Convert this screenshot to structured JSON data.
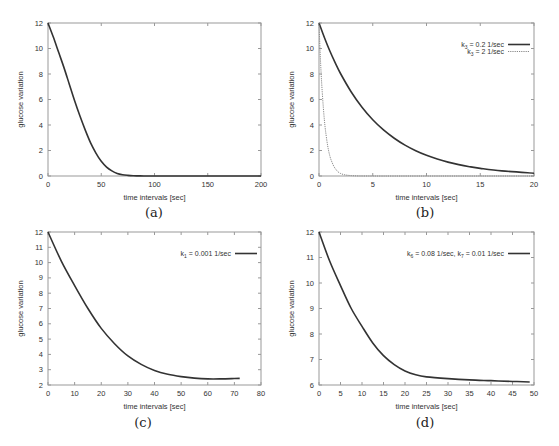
{
  "chart_data": [
    {
      "id": "a",
      "caption": "(a)",
      "type": "line",
      "title": "",
      "xlabel": "time intervals [sec]",
      "ylabel": "glucose variation",
      "xlim": [
        0,
        200
      ],
      "ylim": [
        0,
        12
      ],
      "xticks": [
        0,
        50,
        100,
        150,
        200
      ],
      "yticks": [
        0,
        2,
        4,
        6,
        8,
        10,
        12
      ],
      "grid": false,
      "legend": null,
      "series": [
        {
          "name": "glucose",
          "style": "solid",
          "color": "#333333",
          "x": [
            0,
            5,
            10,
            15,
            20,
            25,
            30,
            35,
            40,
            45,
            50,
            55,
            60,
            65,
            70,
            75,
            80,
            85,
            90,
            100,
            120,
            150,
            200
          ],
          "y": [
            12,
            10.9,
            9.7,
            8.5,
            7.2,
            5.9,
            4.7,
            3.6,
            2.6,
            1.8,
            1.15,
            0.7,
            0.4,
            0.2,
            0.1,
            0.05,
            0.02,
            0.01,
            0.0,
            0.0,
            0.0,
            0.0,
            0.0
          ]
        }
      ]
    },
    {
      "id": "b",
      "caption": "(b)",
      "type": "line",
      "title": "",
      "xlabel": "time intervals [sec]",
      "ylabel": "glucose variation",
      "xlim": [
        0,
        20
      ],
      "ylim": [
        0,
        12
      ],
      "xticks": [
        0,
        5,
        10,
        15,
        20
      ],
      "yticks": [
        0,
        2,
        4,
        6,
        8,
        10,
        12
      ],
      "grid": false,
      "legend": {
        "position": "top-right"
      },
      "series": [
        {
          "name": "k3 = 0.2 1/sec",
          "label_main": "k",
          "label_sub": "3",
          "label_rest": " = 0.2 1/sec",
          "style": "solid",
          "color": "#333333",
          "x": [
            0,
            0.5,
            1,
            1.5,
            2,
            3,
            4,
            5,
            6,
            7,
            8,
            9,
            10,
            11,
            12,
            13,
            14,
            15,
            17,
            20
          ],
          "y": [
            12,
            10.86,
            9.82,
            8.89,
            8.04,
            6.59,
            5.39,
            4.41,
            3.61,
            2.96,
            2.42,
            1.98,
            1.62,
            1.33,
            1.09,
            0.89,
            0.73,
            0.6,
            0.4,
            0.22
          ]
        },
        {
          "name": "k3 = 2 1/sec",
          "label_main": "k",
          "label_sub": "3",
          "label_rest": " = 2 1/sec",
          "style": "dotted",
          "color": "#888888",
          "x": [
            0,
            0.1,
            0.2,
            0.3,
            0.4,
            0.5,
            0.6,
            0.8,
            1.0,
            1.2,
            1.5,
            2,
            3,
            5,
            10,
            20
          ],
          "y": [
            12,
            9.8,
            8.0,
            6.6,
            5.4,
            4.4,
            3.6,
            2.4,
            1.6,
            1.1,
            0.6,
            0.2,
            0.03,
            0,
            0,
            0
          ]
        }
      ]
    },
    {
      "id": "c",
      "caption": "(c)",
      "type": "line",
      "title": "",
      "xlabel": "time intervals [sec]",
      "ylabel": "glucose variation",
      "xlim": [
        0,
        80
      ],
      "ylim": [
        2,
        12
      ],
      "xticks": [
        0,
        10,
        20,
        30,
        40,
        50,
        60,
        70,
        80
      ],
      "yticks": [
        2,
        3,
        4,
        5,
        6,
        7,
        8,
        9,
        10,
        11,
        12
      ],
      "grid": false,
      "legend": {
        "position": "top-right"
      },
      "series": [
        {
          "name": "k1 = 0.001 1/sec",
          "label_main": "k",
          "label_sub": "1",
          "label_rest": " = 0.001 1/sec",
          "style": "solid",
          "color": "#333333",
          "x": [
            0,
            5,
            10,
            15,
            20,
            25,
            30,
            35,
            40,
            45,
            50,
            55,
            60,
            65,
            70,
            72
          ],
          "y": [
            12,
            10.1,
            8.5,
            7.0,
            5.7,
            4.7,
            3.9,
            3.35,
            2.95,
            2.7,
            2.55,
            2.45,
            2.4,
            2.4,
            2.42,
            2.43
          ]
        }
      ]
    },
    {
      "id": "d",
      "caption": "(d)",
      "type": "line",
      "title": "",
      "xlabel": "time intervals [sec]",
      "ylabel": "glucose variation",
      "xlim": [
        0,
        50
      ],
      "ylim": [
        6,
        12
      ],
      "xticks": [
        0,
        5,
        10,
        15,
        20,
        25,
        30,
        35,
        40,
        45,
        50
      ],
      "yticks": [
        6,
        7,
        8,
        9,
        10,
        11,
        12
      ],
      "grid": false,
      "legend": {
        "position": "top-right"
      },
      "series": [
        {
          "name": "k6 = 0.08 1/sec, k7 = 0.01 1/sec",
          "label_main": "k",
          "label_sub": "6",
          "label_rest": " = 0.08 1/sec, k",
          "label_sub2": "7",
          "label_rest2": " = 0.01 1/sec",
          "style": "solid",
          "color": "#333333",
          "x": [
            0,
            2.5,
            5,
            7.5,
            10,
            12.5,
            15,
            17.5,
            20,
            22.5,
            25,
            30,
            35,
            40,
            45,
            49
          ],
          "y": [
            12,
            10.85,
            9.9,
            9.0,
            8.3,
            7.65,
            7.15,
            6.8,
            6.55,
            6.4,
            6.32,
            6.25,
            6.2,
            6.17,
            6.14,
            6.12
          ]
        }
      ]
    }
  ],
  "layout": {
    "frame_color": "#999999",
    "line_color": "#333333"
  }
}
